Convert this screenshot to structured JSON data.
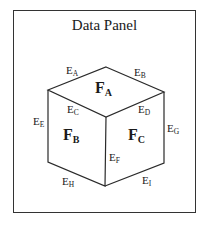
{
  "panel": {
    "title": "Data Panel"
  },
  "cube": {
    "faces": [
      {
        "id": "A",
        "main": "F",
        "sub": "A"
      },
      {
        "id": "B",
        "main": "F",
        "sub": "B"
      },
      {
        "id": "C",
        "main": "F",
        "sub": "C"
      }
    ],
    "edges": [
      {
        "id": "A",
        "main": "E",
        "sub": "A"
      },
      {
        "id": "B",
        "main": "E",
        "sub": "B"
      },
      {
        "id": "C",
        "main": "E",
        "sub": "C"
      },
      {
        "id": "D",
        "main": "E",
        "sub": "D"
      },
      {
        "id": "E",
        "main": "E",
        "sub": "E"
      },
      {
        "id": "F",
        "main": "E",
        "sub": "F"
      },
      {
        "id": "G",
        "main": "E",
        "sub": "G"
      },
      {
        "id": "H",
        "main": "E",
        "sub": "H"
      },
      {
        "id": "I",
        "main": "E",
        "sub": "I"
      }
    ]
  },
  "colors": {
    "line": "#2a2a2a",
    "text": "#1a1a1a",
    "background": "#ffffff"
  }
}
